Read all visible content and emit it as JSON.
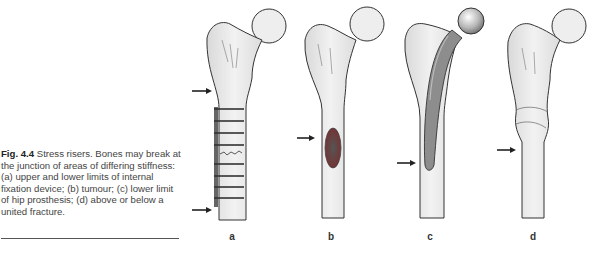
{
  "figure": {
    "number": "Fig. 4.4",
    "caption": "Stress risers. Bones may break at the junction of areas of differing stiffness: (a) upper and lower limits of internal fixation device; (b) tumour; (c) lower limit of hip prosthesis; (d) above or below a united fracture.",
    "panels": [
      {
        "label": "a",
        "description": "femur with internal fixation plate and wire loops; arrows at upper and lower limits"
      },
      {
        "label": "b",
        "description": "femur with tumour lesion in shaft; arrow at tumour"
      },
      {
        "label": "c",
        "description": "femur with hip prosthesis stem; arrow at lower limit of stem"
      },
      {
        "label": "d",
        "description": "femur with united fracture callus; arrow below fracture"
      }
    ]
  }
}
